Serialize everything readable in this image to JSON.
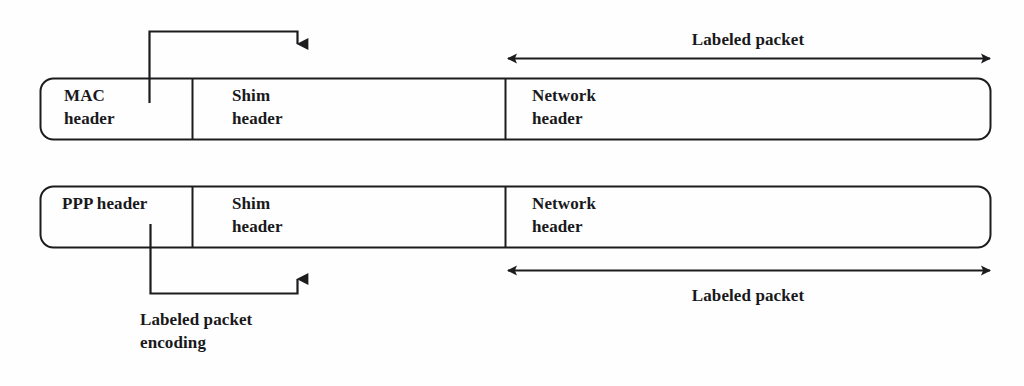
{
  "figure": {
    "type": "packet-encapsulation-diagram",
    "background_color": "#fefefe",
    "line_color": "#1c1c1f",
    "text_color": "#19191c"
  },
  "rows": [
    {
      "id": "mac-row",
      "cells": [
        {
          "id": "mac-header",
          "label": "MAC\nheader"
        },
        {
          "id": "shim-header-top",
          "label": "Shim\nheader"
        },
        {
          "id": "network-header-top",
          "label": "Network\nheader"
        }
      ],
      "span_annotation": {
        "label": "Labeled packet",
        "position": "above",
        "arrow": "double-headed"
      },
      "callout": {
        "label": "",
        "direction": "down",
        "from": "mac-header",
        "to": "shim-header-top"
      }
    },
    {
      "id": "ppp-row",
      "cells": [
        {
          "id": "ppp-header",
          "label": "PPP header"
        },
        {
          "id": "shim-header-bottom",
          "label": "Shim\nheader"
        },
        {
          "id": "network-header-bottom",
          "label": "Network\nheader"
        }
      ],
      "span_annotation": {
        "label": "Labeled packet",
        "position": "below",
        "arrow": "double-headed"
      },
      "callout": {
        "label": "Labeled packet\nencoding",
        "direction": "up",
        "from": "ppp-header",
        "to": "shim-header-bottom"
      }
    }
  ],
  "labels": {
    "top_span": "Labeled packet",
    "bottom_span": "Labeled packet",
    "mac_header": "MAC\nheader",
    "shim_header_top": "Shim\nheader",
    "network_header_top": "Network\nheader",
    "ppp_header": "PPP header",
    "shim_header_bottom": "Shim\nheader",
    "network_header_bottom": "Network\nheader",
    "encoding_callout": "Labeled packet\nencoding"
  }
}
